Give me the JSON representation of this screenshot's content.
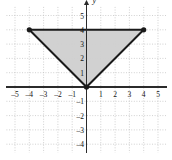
{
  "figure": {
    "bullet_marker": "square-bullet",
    "axis_label_y": "y"
  },
  "chart_data": {
    "type": "scatter",
    "title": "",
    "xlabel": "",
    "ylabel": "y",
    "xlim": [
      -5.6,
      5.6
    ],
    "ylim": [
      -4.6,
      5.6
    ],
    "grid": true,
    "grid_style": "dotted",
    "grid_step": 1,
    "x_ticks": [
      -5,
      -4,
      -3,
      -2,
      -1,
      1,
      2,
      3,
      4,
      5
    ],
    "x_tick_labels": [
      "–5",
      "–4",
      "–3",
      "–2",
      "–1",
      "1",
      "2",
      "3",
      "4",
      "5"
    ],
    "y_ticks": [
      5,
      4,
      3,
      2,
      1,
      -1,
      -2,
      -3,
      -4
    ],
    "y_tick_labels": [
      "5",
      "4",
      "3",
      "2",
      "1",
      "–1",
      "–2",
      "–3",
      "–4"
    ],
    "legend": [],
    "annotations": [],
    "shapes": [
      {
        "name": "shaded-triangle",
        "kind": "polygon",
        "vertices": [
          [
            -4,
            4
          ],
          [
            4,
            4
          ],
          [
            0,
            0
          ]
        ],
        "fill": "#cfcfcf",
        "stroke": "#1a1a1a",
        "stroke_width": 2,
        "vertex_markers": [
          [
            -4,
            4
          ],
          [
            4,
            4
          ],
          [
            0,
            0
          ]
        ],
        "vertex_marker_style": "filled-dot"
      }
    ],
    "colors": {
      "fill": "#cfcfcf",
      "stroke": "#1a1a1a",
      "axis": "#2b2b2b",
      "grid": "#bdbdbd",
      "background": "#ffffff"
    }
  }
}
